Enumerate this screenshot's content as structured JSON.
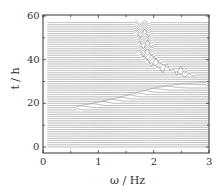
{
  "chart_data": {
    "type": "line",
    "subtype": "waterfall",
    "title": "",
    "xlabel": "ω / Hz",
    "ylabel": "t / h",
    "xlim": [
      0,
      3
    ],
    "ylim": [
      -2,
      60
    ],
    "xticks": [
      0,
      1,
      2,
      3
    ],
    "yticks": [
      0,
      20,
      40,
      60
    ],
    "xtick_labels": [
      "0",
      "1",
      "2",
      "3"
    ],
    "ytick_labels": [
      "0",
      "20",
      "40",
      "60"
    ],
    "grid": false,
    "legend": null,
    "trace_count": 58,
    "trace_spacing_h": 1,
    "trace_x_start": 0.08,
    "trace_x_end": 3.0,
    "features": [
      {
        "name": "rising-mode",
        "points": [
          [
            0.6,
            17.5
          ],
          [
            1.0,
            19.5
          ],
          [
            1.5,
            22.5
          ],
          [
            2.0,
            26
          ],
          [
            2.5,
            28
          ],
          [
            2.95,
            28.5
          ]
        ]
      },
      {
        "name": "peak-ridge",
        "points": [
          [
            1.8,
            57
          ],
          [
            1.8,
            52
          ],
          [
            1.85,
            47
          ],
          [
            1.85,
            43
          ],
          [
            2.0,
            39
          ],
          [
            2.2,
            36
          ],
          [
            2.45,
            35
          ],
          [
            2.6,
            33
          ]
        ]
      }
    ],
    "line_color": "#555555"
  }
}
